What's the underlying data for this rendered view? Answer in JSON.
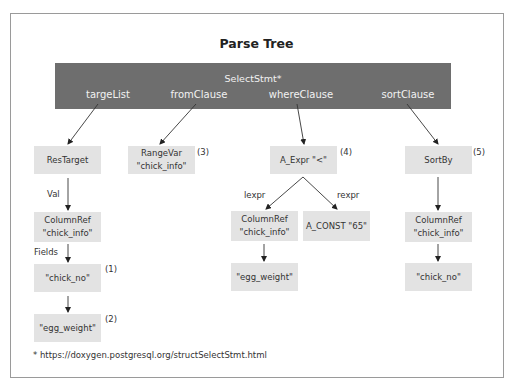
{
  "title": "Parse Tree",
  "root": {
    "label": "SelectStmt*",
    "fields": [
      "targeList",
      "fromClause",
      "whereClause",
      "sortClause"
    ]
  },
  "nodes": {
    "res_target": {
      "line1": "ResTarget",
      "line2": ""
    },
    "range_var": {
      "line1": "RangeVar",
      "line2": "\"chick_info\""
    },
    "a_expr": {
      "line1": "A_Expr \"<\"",
      "line2": ""
    },
    "sort_by": {
      "line1": "SortBy",
      "line2": ""
    },
    "left_column_ref": {
      "line1": "ColumnRef",
      "line2": "\"chick_info\""
    },
    "left_chick_no": {
      "line1": "\"chick_no\"",
      "line2": ""
    },
    "left_egg_weight": {
      "line1": "\"egg_weight\"",
      "line2": ""
    },
    "mid_column_ref": {
      "line1": "ColumnRef",
      "line2": "\"chick_info\""
    },
    "a_const": {
      "line1": "A_CONST \"65\"",
      "line2": ""
    },
    "mid_egg_weight": {
      "line1": "\"egg_weight\"",
      "line2": ""
    },
    "right_column_ref": {
      "line1": "ColumnRef",
      "line2": "\"chick_info\""
    },
    "right_chick_no": {
      "line1": "\"chick_no\"",
      "line2": ""
    }
  },
  "edge_labels": {
    "val": "Val",
    "fields": "Fields",
    "lexpr": "lexpr",
    "rexpr": "rexpr"
  },
  "annotations": {
    "n1": "(1)",
    "n2": "(2)",
    "n3": "(3)",
    "n4": "(4)",
    "n5": "(5)"
  },
  "footer": "* https://doxygen.postgresql.org/structSelectStmt.html"
}
